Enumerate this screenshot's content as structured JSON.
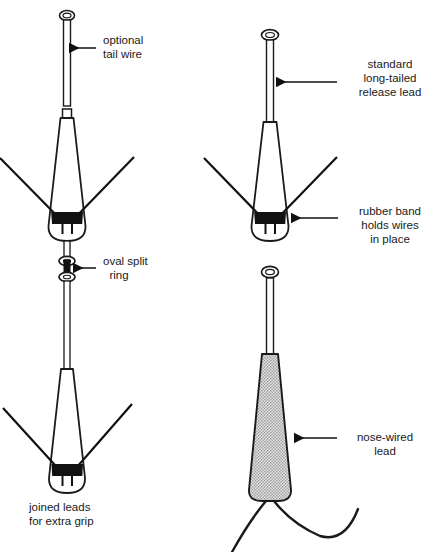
{
  "figure": {
    "title_visible": false,
    "background_color": "#ffffff",
    "line_color": "#1a1a1a",
    "band_color": "#111111",
    "hatch_fill_color": "#c8c8c8",
    "text_color": "#1a1a1a"
  },
  "labels": {
    "optional_tail_wire": {
      "lines": [
        "optional",
        "tail wire"
      ],
      "line1": "optional",
      "line2": "tail wire",
      "align": "left"
    },
    "standard_long_tailed_release_lead": {
      "lines": [
        "standard",
        "long-tailed",
        "release lead"
      ],
      "line1": "standard",
      "line2": "long-tailed",
      "line3": "release lead",
      "align": "center"
    },
    "oval_split_ring": {
      "lines": [
        "oval split",
        "ring"
      ],
      "line1": "oval split",
      "line2": "ring",
      "align": "center"
    },
    "rubber_band_holds_wires_in_place": {
      "lines": [
        "rubber band",
        "holds wires",
        "in place"
      ],
      "line1": "rubber band",
      "line2": "holds wires",
      "line3": "in place",
      "align": "center"
    },
    "joined_leads_for_extra_grip": {
      "lines": [
        "joined leads",
        "for extra grip"
      ],
      "line1": "joined leads",
      "line2": "for extra grip",
      "align": "left"
    },
    "nose_wired_lead": {
      "lines": [
        "nose-wired",
        "lead"
      ],
      "line1": "nose-wired",
      "line2": "lead",
      "align": "center"
    }
  },
  "parts": {
    "tail_wire": {
      "name": "optional tail wire",
      "has_eye_loop": true,
      "fill": "#ffffff"
    },
    "release_lead_cone": {
      "name": "long-tailed release lead body",
      "fill": "#ffffff",
      "has_rubber_band": true,
      "wire_count": 2
    },
    "split_ring": {
      "name": "oval split ring",
      "ring_count": 2
    },
    "joined_leads_cone": {
      "name": "joined leads body",
      "fill": "#ffffff",
      "has_rubber_band": true,
      "wire_count": 2
    },
    "nose_wired_cone": {
      "name": "nose-wired lead body",
      "fill": "hatched-grey",
      "hook_count": 2
    }
  }
}
